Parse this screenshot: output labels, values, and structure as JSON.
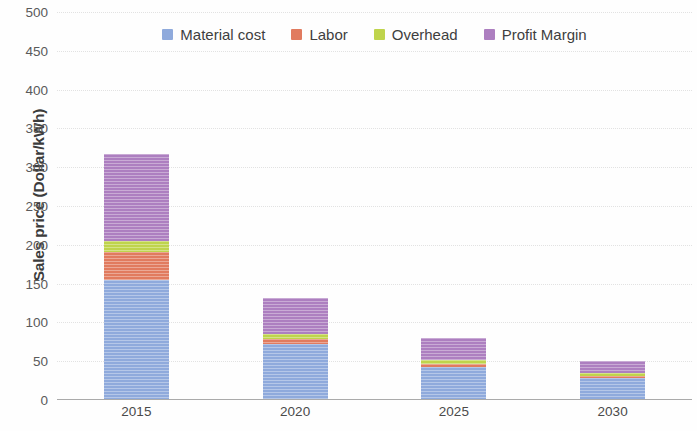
{
  "chart_data": {
    "type": "bar",
    "subtype": "stacked-bar",
    "title": "",
    "xlabel": "",
    "ylabel": "Sales price (Dollar/kWh)",
    "categories": [
      "2015",
      "2020",
      "2025",
      "2030"
    ],
    "ylim": [
      0,
      500
    ],
    "ytick_step": 50,
    "yticks": [
      500,
      450,
      400,
      350,
      300,
      250,
      200,
      150,
      100,
      50,
      0
    ],
    "ytick_labels": [
      "500",
      "450",
      "400",
      "350",
      "300",
      "250",
      "200",
      "150",
      "100",
      "50",
      "0"
    ],
    "grid": "horizontal-dotted",
    "legend_position": "top-center-inside",
    "series": [
      {
        "name": "Material cost",
        "color": "#8FAADC",
        "values": [
          155,
          72,
          43,
          28
        ]
      },
      {
        "name": "Labor",
        "color": "#E17B5F",
        "values": [
          36,
          7,
          4,
          3
        ]
      },
      {
        "name": "Overhead",
        "color": "#BFD44C",
        "values": [
          14,
          6,
          5,
          4
        ]
      },
      {
        "name": "Profit Margin",
        "color": "#AD7FC0",
        "values": [
          112,
          46,
          28,
          15
        ]
      }
    ],
    "totals": [
      317,
      131,
      80,
      50
    ]
  },
  "legend": {
    "items": [
      {
        "label": "Material cost",
        "color": "#8FAADC"
      },
      {
        "label": "Labor",
        "color": "#E17B5F"
      },
      {
        "label": "Overhead",
        "color": "#BFD44C"
      },
      {
        "label": "Profit Margin",
        "color": "#AD7FC0"
      }
    ]
  }
}
